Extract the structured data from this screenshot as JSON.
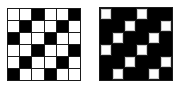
{
  "figures": [
    {
      "id": "grid-a",
      "description": "6x6 weave pattern, mostly white with diagonal black cells",
      "rows": 6,
      "cols": 6,
      "colors": {
        "B": "#000000",
        "W": "#ffffff"
      },
      "cells": [
        [
          "W",
          "W",
          "B",
          "W",
          "W",
          "B"
        ],
        [
          "W",
          "B",
          "W",
          "W",
          "B",
          "W"
        ],
        [
          "B",
          "W",
          "W",
          "B",
          "W",
          "W"
        ],
        [
          "W",
          "W",
          "B",
          "W",
          "W",
          "B"
        ],
        [
          "W",
          "B",
          "W",
          "W",
          "B",
          "W"
        ],
        [
          "B",
          "W",
          "W",
          "B",
          "W",
          "W"
        ]
      ]
    },
    {
      "id": "grid-b",
      "description": "6x6 weave pattern, mostly black with diagonal white cells",
      "rows": 6,
      "cols": 6,
      "colors": {
        "B": "#000000",
        "W": "#ffffff"
      },
      "cells": [
        [
          "W",
          "B",
          "B",
          "W",
          "B",
          "B"
        ],
        [
          "B",
          "B",
          "W",
          "B",
          "B",
          "W"
        ],
        [
          "B",
          "W",
          "B",
          "B",
          "W",
          "B"
        ],
        [
          "W",
          "B",
          "B",
          "W",
          "B",
          "B"
        ],
        [
          "B",
          "B",
          "W",
          "B",
          "B",
          "W"
        ],
        [
          "B",
          "W",
          "B",
          "B",
          "W",
          "B"
        ]
      ]
    }
  ]
}
